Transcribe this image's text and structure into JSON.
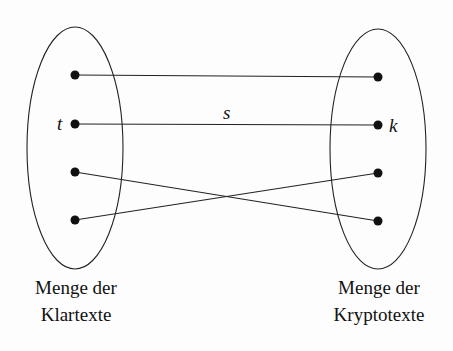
{
  "diagram": {
    "left_set": {
      "label_line1": "Menge der",
      "label_line2": "Klartexte",
      "element_label": "t"
    },
    "right_set": {
      "label_line1": "Menge der",
      "label_line2": "Kryptotexte",
      "element_label": "k"
    },
    "mapping_label": "s",
    "edges": [
      {
        "from": 0,
        "to": 0
      },
      {
        "from": 1,
        "to": 1
      },
      {
        "from": 2,
        "to": 3
      },
      {
        "from": 3,
        "to": 2
      }
    ]
  }
}
